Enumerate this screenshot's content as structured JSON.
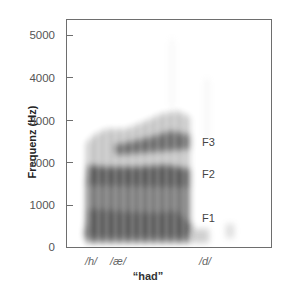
{
  "chart_data": {
    "type": "spectrogram",
    "title": "",
    "xlabel": "“had”",
    "ylabel": "Frequenz (Hz)",
    "ylim": [
      0,
      5400
    ],
    "yticks": [
      0,
      1000,
      2000,
      3000,
      4000,
      5000
    ],
    "ytick_labels": [
      "0",
      "1000",
      "2000",
      "3000",
      "4000",
      "5000"
    ],
    "x_segment_labels": [
      "/h/",
      "/æ/",
      "/d/"
    ],
    "grid": false,
    "formants": [
      {
        "name": "F1",
        "label_freq_hz": 700,
        "freq_start_hz": 650,
        "freq_end_hz": 700
      },
      {
        "name": "F2",
        "label_freq_hz": 1750,
        "freq_start_hz": 1750,
        "freq_end_hz": 1650
      },
      {
        "name": "F3",
        "label_freq_hz": 2500,
        "freq_start_hz": 2300,
        "freq_end_hz": 2550
      }
    ],
    "annotations": [
      "F1",
      "F2",
      "F3"
    ]
  },
  "labels": {
    "y_axis": "Frequenz (Hz)",
    "x_title": "“had”",
    "y_ticks": [
      "5000",
      "4000",
      "3000",
      "2000",
      "1000",
      "0"
    ],
    "segments": [
      "/h/",
      "/æ/",
      "/d/"
    ],
    "formants": [
      "F3",
      "F2",
      "F1"
    ]
  }
}
